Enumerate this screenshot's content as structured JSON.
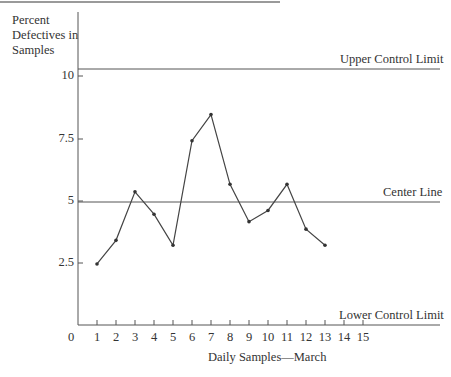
{
  "chart_data": {
    "type": "line",
    "title": "",
    "ylabel": "Percent Defectives in Samples",
    "ylabel_lines": [
      "Percent",
      "Defectives in",
      "Samples"
    ],
    "xlabel": "Daily Samples—March",
    "x": [
      1,
      2,
      3,
      4,
      5,
      6,
      7,
      8,
      9,
      10,
      11,
      12,
      13
    ],
    "values": [
      2.45,
      3.4,
      5.35,
      4.45,
      3.2,
      7.4,
      8.45,
      5.65,
      4.15,
      4.6,
      5.65,
      3.85,
      3.2
    ],
    "xticks": [
      "0",
      "1",
      "2",
      "3",
      "4",
      "5",
      "6",
      "7",
      "8",
      "9",
      "10",
      "11",
      "12",
      "13",
      "14",
      "15"
    ],
    "yticks": [
      "2.5",
      "5",
      "7.5",
      "10"
    ],
    "ylim": [
      0,
      12
    ],
    "xlim": [
      0,
      19
    ],
    "grid": false,
    "reference_lines": [
      {
        "name": "Upper Control Limit",
        "value": 10.3
      },
      {
        "name": "Center Line",
        "value": 5.0
      },
      {
        "name": "Lower Control Limit",
        "value": 0
      }
    ],
    "annotations": [
      "Upper Control Limit",
      "Center Line",
      "Lower Control Limit"
    ]
  },
  "labels": {
    "ylabel_1": "Percent",
    "ylabel_2": "Defectives in",
    "ylabel_3": "Samples",
    "xlabel": "Daily Samples—March",
    "ucl": "Upper Control Limit",
    "center": "Center Line",
    "lcl": "Lower Control Limit",
    "y10": "10",
    "y75": "7.5",
    "y5": "5",
    "y25": "2.5",
    "x0": "0"
  },
  "colors": {
    "line": "#444444",
    "axis": "#555555"
  }
}
